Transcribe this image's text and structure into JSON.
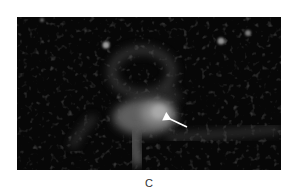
{
  "figure": {
    "panel_label": "C",
    "image": {
      "type": "fluorescence-micrograph",
      "background_color": "#070707",
      "annotation": {
        "type": "arrow",
        "color": "#ffffff",
        "points_to": "bright-region"
      }
    }
  }
}
